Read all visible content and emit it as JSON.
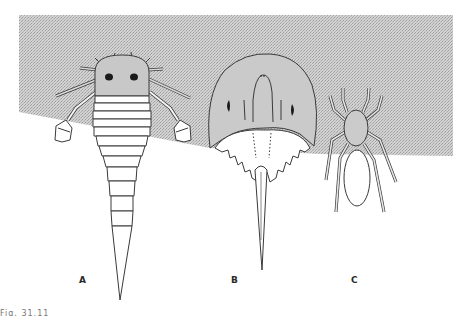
{
  "figure": {
    "background_color": "#ffffff",
    "shaded_region_color": "#c9c9c9",
    "line_color": "#3a3a3a",
    "panels": [
      {
        "id": "A",
        "label": "A",
        "subject": "eurypterid (sea scorpion), dorsal view"
      },
      {
        "id": "B",
        "label": "B",
        "subject": "horseshoe crab, dorsal view"
      },
      {
        "id": "C",
        "label": "C",
        "subject": "spider, dorsal view"
      }
    ],
    "caption_fragment": "Fig. 31.11"
  }
}
